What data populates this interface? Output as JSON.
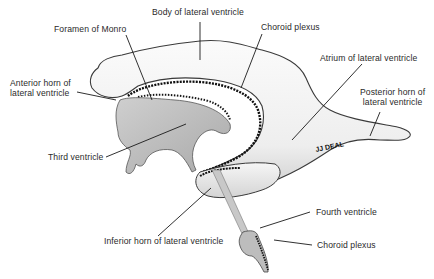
{
  "signature": "JJ DEAL",
  "colors": {
    "background": "#ffffff",
    "ventricle_fill_light": "#f2f2f2",
    "ventricle_fill_mid": "#d8d8d8",
    "third_ventricle_fill": "#bdbdbd",
    "outline": "#333333",
    "choroid_plexus": "#111111",
    "leader_line": "#1a1a1a",
    "text": "#2a2a2a"
  },
  "labels": {
    "body_of_lateral_ventricle": "Body of lateral ventricle",
    "foramen_of_monro": "Foramen of Monro",
    "choroid_plexus_top": "Choroid plexus",
    "anterior_horn_line1": "Anterior horn of",
    "anterior_horn_line2": "lateral ventricle",
    "atrium": "Atrium of lateral ventricle",
    "posterior_horn_line1": "Posterior horn of",
    "posterior_horn_line2": "lateral ventricle",
    "third_ventricle": "Third ventricle",
    "inferior_horn": "Inferior horn of lateral ventricle",
    "fourth_ventricle": "Fourth ventricle",
    "choroid_plexus_bottom": "Choroid plexus"
  }
}
